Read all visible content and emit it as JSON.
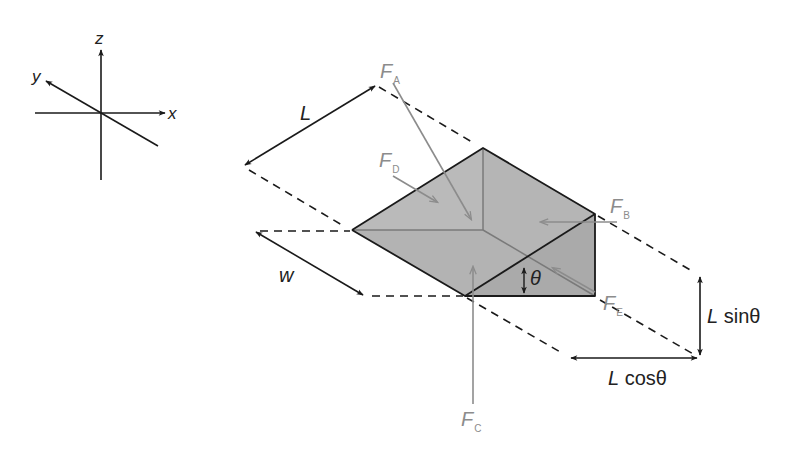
{
  "diagram": {
    "axes": {
      "x_label": "x",
      "y_label": "y",
      "z_label": "z"
    },
    "dimensions": {
      "length_label": "L",
      "width_label": "w",
      "angle_label": "θ",
      "vertical_label_var": "L",
      "vertical_label_fn": " sinθ",
      "horizontal_label_var": "L",
      "horizontal_label_fn": " cosθ"
    },
    "forces": [
      {
        "id": "A",
        "symbol": "F",
        "subscript": "A",
        "description": "force on sloped top face"
      },
      {
        "id": "B",
        "symbol": "F",
        "subscript": "B",
        "description": "force on vertical end face"
      },
      {
        "id": "C",
        "symbol": "F",
        "subscript": "C",
        "description": "force on bottom face"
      },
      {
        "id": "D",
        "symbol": "F",
        "subscript": "D",
        "description": "force on triangular side face (front)"
      },
      {
        "id": "E",
        "symbol": "F",
        "subscript": "E",
        "description": "force on triangular side face (back)"
      }
    ],
    "colors": {
      "line": "#1a1a1a",
      "force": "#8c8c8c",
      "face_light": "#bdbdbd",
      "face_mid": "#b0b0b0",
      "face_dark": "#a6a6a6",
      "hidden_edge": "#7a7a7a"
    }
  }
}
